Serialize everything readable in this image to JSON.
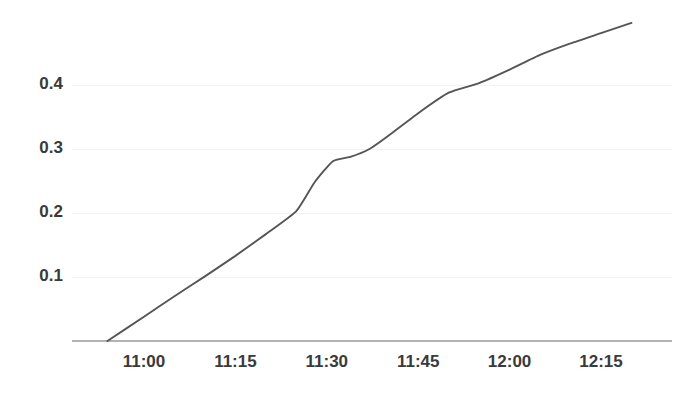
{
  "chart_data": {
    "type": "line",
    "title": "",
    "subtitle": "",
    "xlabel": "",
    "ylabel": "",
    "grid": true,
    "legend": false,
    "legend_position": "none",
    "line_color": "#555555",
    "gridline_color": "#f3f3f3",
    "axis_color": "#b3b3b3",
    "label_color": "#3a3a3a",
    "background_color": "#ffffff",
    "x_type": "time",
    "xlim": [
      "10:55",
      "12:22"
    ],
    "ylim": [
      0.0,
      0.52
    ],
    "ytick_values": [
      0.1,
      0.2,
      0.3,
      0.4
    ],
    "ytick_labels": [
      "0.1",
      "0.2",
      "0.3",
      "0.4"
    ],
    "xtick_labels": [
      "11:00",
      "11:15",
      "11:30",
      "11:45",
      "12:00",
      "12:15"
    ],
    "xtick_values": [
      "11:00",
      "11:15",
      "11:30",
      "11:45",
      "12:00",
      "12:15"
    ],
    "series": [
      {
        "name": "series-1",
        "color": "#555555",
        "x": [
          "10:54",
          "11:00",
          "11:05",
          "11:10",
          "11:15",
          "11:20",
          "11:25",
          "11:28",
          "11:31",
          "11:34",
          "11:37",
          "11:40",
          "11:45",
          "11:50",
          "11:55",
          "12:00",
          "12:05",
          "12:10",
          "12:15",
          "12:20"
        ],
        "y": [
          0.0,
          0.038,
          0.07,
          0.101,
          0.133,
          0.167,
          0.203,
          0.248,
          0.281,
          0.288,
          0.3,
          0.32,
          0.356,
          0.388,
          0.403,
          0.424,
          0.447,
          0.465,
          0.481,
          0.497
        ]
      }
    ]
  }
}
